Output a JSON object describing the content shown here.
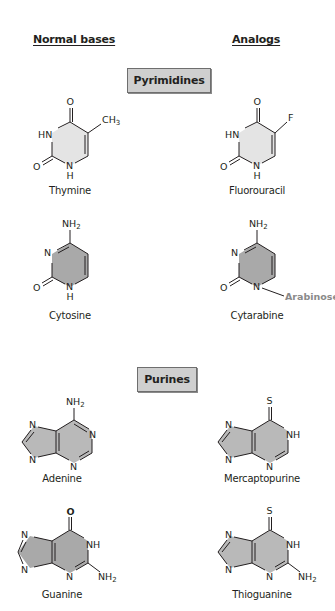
{
  "headers": {
    "normal_bases": "Normal bases",
    "analogs": "Analogs"
  },
  "sections": {
    "pyrimidines": "Pyrimidines",
    "purines": "Purines"
  },
  "molecules": {
    "thymine": {
      "name": "Thymine",
      "substituent": "CH3",
      "atoms": [
        "O",
        "HN",
        "O",
        "N",
        "H",
        "CH",
        "3"
      ]
    },
    "fluorouracil": {
      "name": "Fluorouracil",
      "substituent": "F",
      "atoms": [
        "O",
        "HN",
        "O",
        "N",
        "H",
        "F"
      ]
    },
    "cytosine": {
      "name": "Cytosine",
      "atoms": [
        "NH",
        "2",
        "N",
        "O",
        "N",
        "H"
      ]
    },
    "cytarabine": {
      "name": "Cytarabine",
      "atoms": [
        "NH",
        "2",
        "N",
        "O",
        "N"
      ],
      "sugar": "Arabinose"
    },
    "adenine": {
      "name": "Adenine",
      "atoms": [
        "NH",
        "2",
        "N",
        "N",
        "N",
        "N"
      ]
    },
    "mercaptopurine": {
      "name": "Mercaptopurine",
      "atoms": [
        "S",
        "N",
        "NH",
        "N",
        "N"
      ]
    },
    "guanine": {
      "name": "Guanine",
      "atoms": [
        "O",
        "N",
        "NH",
        "N",
        "N",
        "NH",
        "2"
      ]
    },
    "thioguanine": {
      "name": "Thioguanine",
      "atoms": [
        "S",
        "N",
        "NH",
        "N",
        "N",
        "NH",
        "2"
      ]
    }
  },
  "colors": {
    "light_ring": "#e4e4e4",
    "dark_ring": "#a9a9a9",
    "purine_ring": "#b9b9b9",
    "section_box": "#cfcfcf",
    "arabinose_text": "#8a8a8a"
  }
}
